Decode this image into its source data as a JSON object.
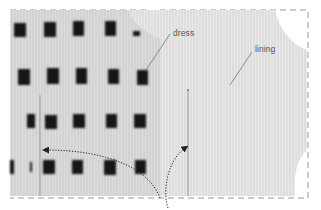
{
  "illustration": {
    "labels": {
      "dress": "dress",
      "lining": "lining"
    },
    "colors": {
      "background": "#ffffff",
      "lining": "#e2e2e2",
      "dress_fabric": "#d6d6d6",
      "check_square": "#141414",
      "seam_line": "#8a8a8a",
      "arrow": "#222222",
      "dashed_border": "#9a9a9a",
      "leader_line": "#666666"
    },
    "arrows": [
      {
        "name": "left-seam-arrow",
        "direction": "left"
      },
      {
        "name": "right-seam-arrow",
        "direction": "up"
      }
    ]
  }
}
